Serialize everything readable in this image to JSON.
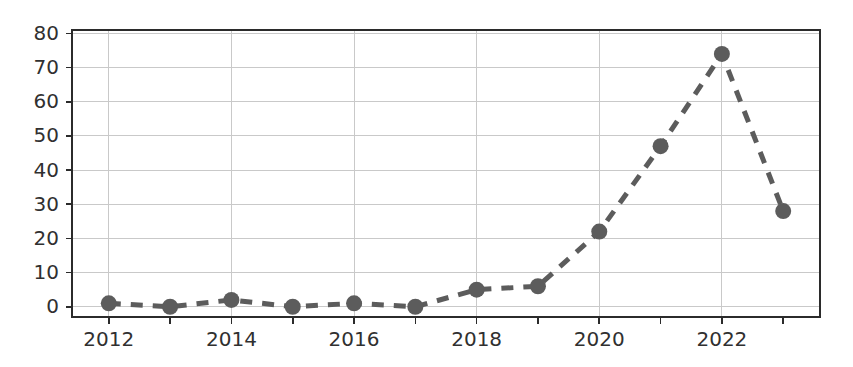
{
  "chart_data": {
    "type": "line",
    "title": "",
    "subtitle": "",
    "xlabel": "",
    "ylabel": "",
    "x": [
      2012,
      2013,
      2014,
      2015,
      2016,
      2017,
      2018,
      2019,
      2020,
      2021,
      2022,
      2023
    ],
    "values": [
      1,
      0,
      2,
      0,
      1,
      0,
      5,
      6,
      22,
      47,
      74,
      28
    ],
    "series": [
      {
        "name": "",
        "values": [
          1,
          0,
          2,
          0,
          1,
          0,
          5,
          6,
          22,
          47,
          74,
          28
        ]
      }
    ],
    "xlim": [
      2011.4,
      2023.6
    ],
    "ylim": [
      -3,
      81
    ],
    "ytick_labels": [
      "0",
      "10",
      "20",
      "30",
      "40",
      "50",
      "60",
      "70",
      "80"
    ],
    "ytick_values": [
      0,
      10,
      20,
      30,
      40,
      50,
      60,
      70,
      80
    ],
    "xtick_labels": [
      "2012",
      "2014",
      "2016",
      "2018",
      "2020",
      "2022"
    ],
    "xtick_values": [
      2012,
      2014,
      2016,
      2018,
      2020,
      2022
    ],
    "xtick_minor_values": [
      2013,
      2015,
      2017,
      2019,
      2021,
      2023
    ],
    "grid": true,
    "grid_axes": "both",
    "legend": false,
    "legend_position": "none",
    "line_style": "dashed",
    "marker": "circle",
    "marker_size": 15,
    "colors": {
      "series": "#5c5c5c",
      "grid": "#c9c9c9",
      "spine": "#2b2b2b",
      "tick_label": "#303030",
      "background": "#ffffff"
    }
  }
}
